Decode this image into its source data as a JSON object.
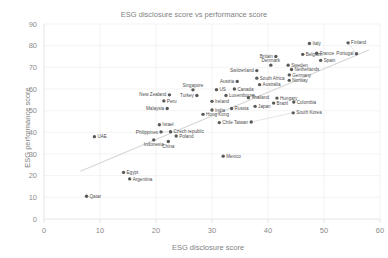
{
  "chart_data": {
    "type": "scatter",
    "title": "ESG disclosure score vs performance score",
    "xlabel": "ESG disclosure score",
    "ylabel": "ESG performance score",
    "xlim": [
      0,
      60
    ],
    "ylim": [
      0,
      90
    ],
    "xticks": [
      "0",
      "10",
      "20",
      "30",
      "40",
      "50",
      "60"
    ],
    "yticks": [
      "0",
      "10",
      "20",
      "30",
      "40",
      "50",
      "60",
      "70",
      "80",
      "90"
    ],
    "grid": true,
    "legend": "none",
    "point_color": "#595959",
    "trendline": {
      "visible": true,
      "color": "#d6d6d6",
      "x0": 6.5,
      "y0": 22.0,
      "x1": 58.0,
      "y1": 78.0
    },
    "points": [
      {
        "label": "Qatar",
        "x": 7.6,
        "y": 10.5,
        "lpos": "right"
      },
      {
        "label": "Egypt",
        "x": 14.2,
        "y": 21.5,
        "lpos": "right"
      },
      {
        "label": "Argentina",
        "x": 15.3,
        "y": 18.5,
        "lpos": "right"
      },
      {
        "label": "UAE",
        "x": 9.0,
        "y": 38.0,
        "lpos": "right"
      },
      {
        "label": "Indonesia",
        "x": 19.6,
        "y": 36.5,
        "lpos": "below"
      },
      {
        "label": "China",
        "x": 22.2,
        "y": 35.8,
        "lpos": "below"
      },
      {
        "label": "Philippines",
        "x": 20.9,
        "y": 40.2,
        "lpos": "left"
      },
      {
        "label": "Czech republic",
        "x": 22.6,
        "y": 40.3,
        "lpos": "right"
      },
      {
        "label": "Poland",
        "x": 23.6,
        "y": 38.3,
        "lpos": "right"
      },
      {
        "label": "Israel",
        "x": 20.6,
        "y": 43.5,
        "lpos": "right"
      },
      {
        "label": "Mexico",
        "x": 32.0,
        "y": 29.0,
        "lpos": "right"
      },
      {
        "label": "Malaysia",
        "x": 22.0,
        "y": 51.0,
        "lpos": "left"
      },
      {
        "label": "Peru",
        "x": 21.4,
        "y": 54.5,
        "lpos": "right"
      },
      {
        "label": "New Zealand",
        "x": 22.4,
        "y": 57.3,
        "lpos": "left"
      },
      {
        "label": "Singapore",
        "x": 26.6,
        "y": 59.6,
        "lpos": "above"
      },
      {
        "label": "Turkey",
        "x": 27.3,
        "y": 57.0,
        "lpos": "left"
      },
      {
        "label": "US",
        "x": 30.8,
        "y": 59.7,
        "lpos": "right"
      },
      {
        "label": "Luxembourg",
        "x": 32.5,
        "y": 57.0,
        "lpos": "right"
      },
      {
        "label": "Ireland",
        "x": 30.0,
        "y": 54.3,
        "lpos": "right"
      },
      {
        "label": "India",
        "x": 30.0,
        "y": 50.3,
        "lpos": "right"
      },
      {
        "label": "Hong Kong",
        "x": 28.4,
        "y": 48.3,
        "lpos": "right"
      },
      {
        "label": "Russia",
        "x": 33.5,
        "y": 51.0,
        "lpos": "right"
      },
      {
        "label": "Chile",
        "x": 31.3,
        "y": 44.5,
        "lpos": "right"
      },
      {
        "label": "Canada",
        "x": 34.0,
        "y": 60.0,
        "lpos": "right"
      },
      {
        "label": "Austria",
        "x": 34.5,
        "y": 63.5,
        "lpos": "left"
      },
      {
        "label": "Thailand",
        "x": 36.5,
        "y": 56.0,
        "lpos": "right"
      },
      {
        "label": "Japan",
        "x": 37.7,
        "y": 52.0,
        "lpos": "right"
      },
      {
        "label": "Australia",
        "x": 38.5,
        "y": 62.0,
        "lpos": "right"
      },
      {
        "label": "Switzerland",
        "x": 38.0,
        "y": 68.5,
        "lpos": "left"
      },
      {
        "label": "Denmark",
        "x": 40.5,
        "y": 71.0,
        "lpos": "above"
      },
      {
        "label": "South Africa",
        "x": 38.0,
        "y": 65.0,
        "lpos": "right"
      },
      {
        "label": "Britain",
        "x": 41.4,
        "y": 75.0,
        "lpos": "left"
      },
      {
        "label": "Sweden",
        "x": 43.6,
        "y": 71.0,
        "lpos": "right"
      },
      {
        "label": "Netherlands",
        "x": 44.2,
        "y": 69.0,
        "lpos": "right"
      },
      {
        "label": "Germany",
        "x": 43.8,
        "y": 66.5,
        "lpos": "right"
      },
      {
        "label": "Norway",
        "x": 43.8,
        "y": 64.0,
        "lpos": "right"
      },
      {
        "label": "Hungary",
        "x": 41.6,
        "y": 55.8,
        "lpos": "right"
      },
      {
        "label": "Brazil",
        "x": 41.0,
        "y": 53.5,
        "lpos": "right"
      },
      {
        "label": "Colombia",
        "x": 44.6,
        "y": 54.0,
        "lpos": "right"
      },
      {
        "label": "South Korea",
        "x": 44.5,
        "y": 49.0,
        "lpos": "right"
      },
      {
        "label": "Taiwan",
        "x": 37.0,
        "y": 44.8,
        "lpos": "left"
      },
      {
        "label": "Belgium",
        "x": 46.2,
        "y": 76.0,
        "lpos": "right"
      },
      {
        "label": "Italy",
        "x": 47.4,
        "y": 81.0,
        "lpos": "right"
      },
      {
        "label": "France",
        "x": 48.7,
        "y": 76.5,
        "lpos": "right"
      },
      {
        "label": "Spain",
        "x": 49.4,
        "y": 73.2,
        "lpos": "right"
      },
      {
        "label": "Portugal",
        "x": 55.8,
        "y": 76.3,
        "lpos": "left"
      },
      {
        "label": "Finland",
        "x": 54.3,
        "y": 81.3,
        "lpos": "right"
      }
    ]
  }
}
